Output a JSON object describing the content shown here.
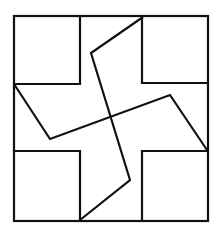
{
  "figure": {
    "stroke_color": "#111111",
    "background": "#ffffff",
    "stroke_width": 2.2,
    "outer_square": {
      "x": 14,
      "y": 16,
      "w": 194,
      "h": 205
    },
    "corner_squares": [
      {
        "name": "top-left",
        "points": [
          [
            14,
            84
          ],
          [
            80,
            84
          ],
          [
            80,
            16
          ]
        ]
      },
      {
        "name": "top-right",
        "points": [
          [
            142,
            16
          ],
          [
            142,
            83
          ],
          [
            208,
            83
          ]
        ]
      },
      {
        "name": "bottom-left",
        "points": [
          [
            14,
            151
          ],
          [
            80,
            151
          ],
          [
            80,
            221
          ]
        ]
      },
      {
        "name": "bottom-right",
        "points": [
          [
            208,
            151
          ],
          [
            142,
            151
          ],
          [
            142,
            221
          ]
        ]
      }
    ],
    "pinwheel_lines": [
      {
        "name": "vertical-zigzag",
        "points": [
          [
            143,
            17
          ],
          [
            91,
            53
          ],
          [
            130,
            180
          ],
          [
            80,
            220
          ]
        ]
      },
      {
        "name": "horizontal-zigzag",
        "points": [
          [
            14,
            84
          ],
          [
            50,
            139
          ],
          [
            170,
            95
          ],
          [
            207,
            150
          ]
        ]
      }
    ]
  }
}
